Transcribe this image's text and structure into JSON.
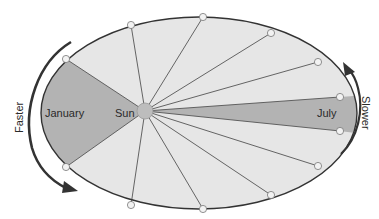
{
  "diagram": {
    "labels": {
      "january": "January",
      "july": "July",
      "sun": "Sun",
      "faster": "Faster",
      "slower": "Slower"
    },
    "colors": {
      "orbit_fill": "#e6e6e6",
      "sector_fill": "#b3b3b3",
      "orbit_stroke": "#333333",
      "spoke": "#555555",
      "sun_fill": "#bdbdbd",
      "point_fill": "#f2f2f2",
      "arrow": "#333333"
    },
    "orbit": {
      "cx": 199,
      "cy": 113,
      "rx": 158,
      "ry": 96
    },
    "sun": {
      "x": 145,
      "y": 111,
      "r": 8
    },
    "points": [
      {
        "x": 66,
        "y": 59
      },
      {
        "x": 131,
        "y": 25
      },
      {
        "x": 203,
        "y": 17
      },
      {
        "x": 271,
        "y": 33
      },
      {
        "x": 318,
        "y": 62
      },
      {
        "x": 340,
        "y": 97
      },
      {
        "x": 340,
        "y": 131
      },
      {
        "x": 318,
        "y": 166
      },
      {
        "x": 271,
        "y": 195
      },
      {
        "x": 203,
        "y": 209
      },
      {
        "x": 131,
        "y": 205
      },
      {
        "x": 66,
        "y": 167
      }
    ],
    "shaded_sectors": [
      {
        "name": "january",
        "from": 11,
        "to": 0
      },
      {
        "name": "july",
        "from": 5,
        "to": 6
      }
    ]
  }
}
